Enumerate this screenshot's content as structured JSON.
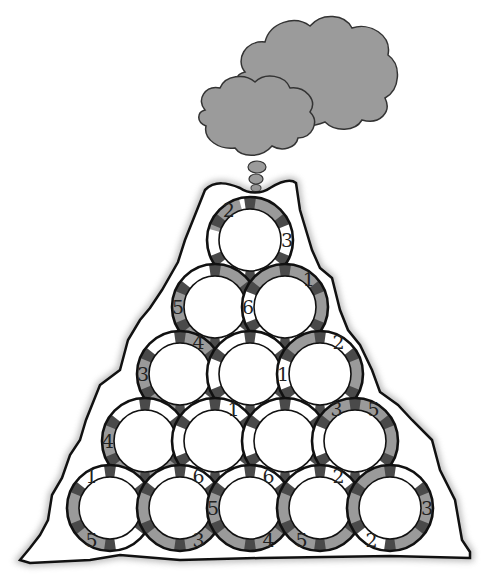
{
  "puzzle": {
    "title": "Volcano circle number puzzle",
    "colors": {
      "background": "#ffffff",
      "outline": "#111111",
      "ring_gray": "#9a9a9a",
      "lens_dark": "#4a4a4a",
      "smoke": "#9b9b9b",
      "guide_line": "#555555"
    },
    "geometry": {
      "origin_x": 250,
      "origin_y": 240,
      "dx": 70,
      "dy": 67,
      "radius": 43,
      "inner_radius": 31
    },
    "circles": [
      {
        "row": 0,
        "col": 0,
        "labels": [
          {
            "text": "2",
            "angle": 235
          },
          {
            "text": "3",
            "angle": 0
          }
        ],
        "shaded": [
          225,
          300
        ]
      },
      {
        "row": 1,
        "col": 0,
        "labels": [
          {
            "text": "5",
            "angle": 180
          }
        ],
        "shaded": [
          120,
          180,
          300
        ]
      },
      {
        "row": 1,
        "col": 1,
        "labels": [
          {
            "text": "1",
            "angle": 310
          },
          {
            "text": "6",
            "angle": 180
          }
        ],
        "shaded": [
          0,
          240,
          300
        ]
      },
      {
        "row": 2,
        "col": 0,
        "labels": [
          {
            "text": "3",
            "angle": 180
          },
          {
            "text": "4",
            "angle": 300
          }
        ],
        "shaded": [
          120,
          180,
          300
        ]
      },
      {
        "row": 2,
        "col": 1,
        "labels": [],
        "shaded": []
      },
      {
        "row": 2,
        "col": 2,
        "labels": [
          {
            "text": "2",
            "angle": 300
          },
          {
            "text": "1",
            "angle": 180
          }
        ],
        "shaded": [
          0,
          240
        ]
      },
      {
        "row": 3,
        "col": 0,
        "labels": [
          {
            "text": "4",
            "angle": 180
          }
        ],
        "shaded": [
          60,
          120,
          180
        ]
      },
      {
        "row": 3,
        "col": 1,
        "labels": [
          {
            "text": "1",
            "angle": 300
          }
        ],
        "shaded": []
      },
      {
        "row": 3,
        "col": 2,
        "labels": [],
        "shaded": []
      },
      {
        "row": 3,
        "col": 3,
        "labels": [
          {
            "text": "3",
            "angle": 240
          },
          {
            "text": "5",
            "angle": 300
          }
        ],
        "shaded": [
          0,
          240,
          300
        ]
      },
      {
        "row": 4,
        "col": 0,
        "labels": [
          {
            "text": "1",
            "angle": 240
          },
          {
            "text": "5",
            "angle": 120
          }
        ],
        "shaded": [
          0,
          120,
          180
        ]
      },
      {
        "row": 4,
        "col": 1,
        "labels": [
          {
            "text": "6",
            "angle": 300
          },
          {
            "text": "3",
            "angle": 60
          }
        ],
        "shaded": [
          0,
          60,
          120,
          180
        ]
      },
      {
        "row": 4,
        "col": 2,
        "labels": [
          {
            "text": "5",
            "angle": 180
          },
          {
            "text": "6",
            "angle": 300
          },
          {
            "text": "4",
            "angle": 60
          }
        ],
        "shaded": [
          0,
          60,
          120,
          180
        ]
      },
      {
        "row": 4,
        "col": 3,
        "labels": [
          {
            "text": "2",
            "angle": 300
          },
          {
            "text": "5",
            "angle": 120
          }
        ],
        "shaded": [
          0,
          60,
          120,
          180
        ]
      },
      {
        "row": 4,
        "col": 4,
        "labels": [
          {
            "text": "3",
            "angle": 0
          },
          {
            "text": "2",
            "angle": 120
          }
        ],
        "shaded": [
          0,
          60,
          180,
          240
        ]
      }
    ]
  }
}
